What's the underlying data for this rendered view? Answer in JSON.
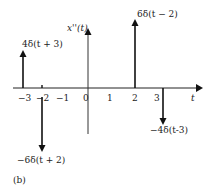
{
  "figure": {
    "panel_label": "(b)",
    "y_axis_label": "x''(t)",
    "x_axis_label": "t",
    "ticks": [
      {
        "label": "−3",
        "x": 23
      },
      {
        "label": "−2",
        "x": 42
      },
      {
        "label": "−1",
        "x": 62
      },
      {
        "label": "0",
        "x": 86
      },
      {
        "label": "1",
        "x": 109
      },
      {
        "label": "2",
        "x": 134
      },
      {
        "label": "3",
        "x": 156
      }
    ],
    "impulses": [
      {
        "t": -3,
        "weight": 4,
        "label": "4δ(t + 3)"
      },
      {
        "t": -2,
        "weight": -6,
        "label": "−6δ(t + 2)"
      },
      {
        "t": 2,
        "weight": 6,
        "label": "6δ(t − 2)"
      },
      {
        "t": 3,
        "weight": -4,
        "label": "−4δ(t-3)"
      }
    ]
  }
}
